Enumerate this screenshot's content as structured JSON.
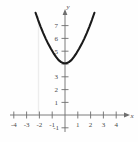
{
  "figure": {
    "title": "",
    "background_color": "#fefefe",
    "axis_color": "#6e6e6e",
    "curve_color": "#1a1a1a",
    "label_color": "#4a4a4a",
    "artifact_color": "#ededed"
  },
  "axes": {
    "x_axis_label": "x",
    "y_axis_label": "y",
    "x_ticks": [
      {
        "value": -4,
        "label": "-4"
      },
      {
        "value": -3,
        "label": "-3"
      },
      {
        "value": -2,
        "label": "-2"
      },
      {
        "value": -1,
        "label": "-1"
      },
      {
        "value": 1,
        "label": "1"
      },
      {
        "value": 2,
        "label": "2"
      },
      {
        "value": 3,
        "label": "3"
      },
      {
        "value": 4,
        "label": "4"
      }
    ],
    "y_ticks": [
      {
        "value": 7,
        "label": "7"
      },
      {
        "value": 6,
        "label": "6"
      },
      {
        "value": 5,
        "label": "5"
      },
      {
        "value": 3,
        "label": "3"
      },
      {
        "value": 2,
        "label": "2"
      },
      {
        "value": 1,
        "label": "1"
      },
      {
        "value": -1,
        "label": "-1"
      }
    ]
  },
  "chart_data": {
    "type": "line",
    "title": "",
    "xlabel": "x",
    "ylabel": "y",
    "xlim": [
      -4.6,
      4.6
    ],
    "ylim": [
      -1.6,
      7.9
    ],
    "grid": false,
    "legend": "none",
    "series": [
      {
        "name": "parabola",
        "description": "upward-opening parabola, vertex near (0, 4.3)",
        "x": [
          -2.3,
          -2.1,
          -1.9,
          -1.7,
          -1.5,
          -1.3,
          -1.1,
          -0.9,
          -0.7,
          -0.5,
          -0.3,
          -0.1,
          0.1,
          0.3,
          0.5,
          0.7,
          0.9,
          1.1,
          1.3,
          1.5,
          1.7,
          1.9,
          2.1,
          2.3
        ],
        "y": [
          7.99,
          7.42,
          6.89,
          6.4,
          5.95,
          5.54,
          5.17,
          4.84,
          4.54,
          4.29,
          4.13,
          4.04,
          4.04,
          4.13,
          4.29,
          4.54,
          4.84,
          5.17,
          5.54,
          5.95,
          6.4,
          6.89,
          7.42,
          7.99
        ]
      }
    ]
  }
}
